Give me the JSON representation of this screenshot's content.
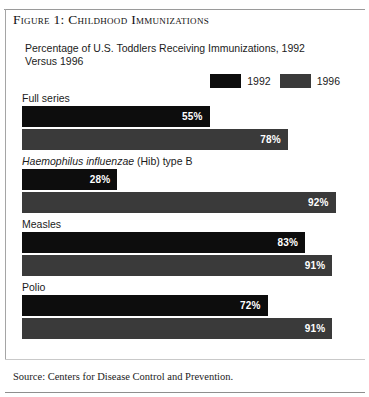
{
  "figure": {
    "title": "Figure 1: Childhood Immunizations",
    "subtitle": "Percentage of U.S. Toddlers Receiving Immunizations, 1992 Versus 1996",
    "source": "Source: Centers for Disease Control and Prevention."
  },
  "legend": {
    "items": [
      {
        "label": "1992",
        "color": "#0d0d0d"
      },
      {
        "label": "1996",
        "color": "#3a3a3a"
      }
    ]
  },
  "groups": [
    {
      "label": "Full series",
      "label_italic": "",
      "label_rest": "",
      "bars": [
        {
          "series": "1992",
          "value": 55,
          "value_label": "55%",
          "color": "#0d0d0d"
        },
        {
          "series": "1996",
          "value": 78,
          "value_label": "78%",
          "color": "#3a3a3a"
        }
      ]
    },
    {
      "label": "Haemophilus influenzae (Hib) type B",
      "label_italic": "Haemophilus influenzae",
      "label_rest": " (Hib) type B",
      "bars": [
        {
          "series": "1992",
          "value": 28,
          "value_label": "28%",
          "color": "#0d0d0d"
        },
        {
          "series": "1996",
          "value": 92,
          "value_label": "92%",
          "color": "#3a3a3a"
        }
      ]
    },
    {
      "label": "Measles",
      "label_italic": "",
      "label_rest": "",
      "bars": [
        {
          "series": "1992",
          "value": 83,
          "value_label": "83%",
          "color": "#0d0d0d"
        },
        {
          "series": "1996",
          "value": 91,
          "value_label": "91%",
          "color": "#3a3a3a"
        }
      ]
    },
    {
      "label": "Polio",
      "label_italic": "",
      "label_rest": "",
      "bars": [
        {
          "series": "1992",
          "value": 72,
          "value_label": "72%",
          "color": "#0d0d0d"
        },
        {
          "series": "1996",
          "value": 91,
          "value_label": "91%",
          "color": "#3a3a3a"
        }
      ]
    }
  ],
  "chart_data": {
    "type": "bar",
    "orientation": "horizontal",
    "title": "Figure 1: Childhood Immunizations",
    "subtitle": "Percentage of U.S. Toddlers Receiving Immunizations, 1992 Versus 1996",
    "categories": [
      "Full series",
      "Haemophilus influenzae (Hib) type B",
      "Measles",
      "Polio"
    ],
    "series": [
      {
        "name": "1992",
        "color": "#0d0d0d",
        "values": [
          55,
          28,
          83,
          72
        ]
      },
      {
        "name": "1996",
        "color": "#3a3a3a",
        "values": [
          78,
          92,
          91,
          91
        ]
      }
    ],
    "data_labels": [
      {
        "category": "Full series",
        "1992": "55%",
        "1996": "78%"
      },
      {
        "category": "Haemophilus influenzae (Hib) type B",
        "1992": "28%",
        "1996": "92%"
      },
      {
        "category": "Measles",
        "1992": "83%",
        "1996": "91%"
      },
      {
        "category": "Polio",
        "1992": "72%",
        "1996": "91%"
      }
    ],
    "xlabel": "",
    "ylabel": "",
    "xlim": [
      0,
      100
    ],
    "unit": "%",
    "grid": false,
    "legend_position": "top-right",
    "annotations": [
      "Source: Centers for Disease Control and Prevention."
    ]
  }
}
